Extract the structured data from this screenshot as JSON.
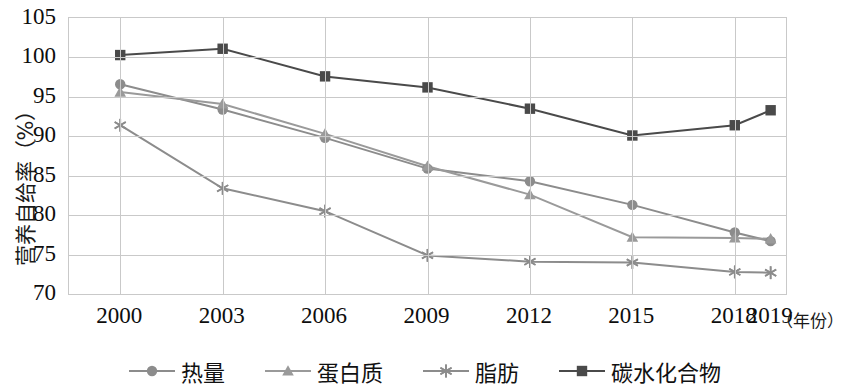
{
  "chart_data": {
    "type": "line",
    "title": "",
    "xlabel": "（年份）",
    "ylabel": "营养自给率（%）",
    "x": [
      "2000",
      "2003",
      "2006",
      "2009",
      "2012",
      "2015",
      "2018",
      "2019"
    ],
    "categories": [
      "2000",
      "2003",
      "2006",
      "2009",
      "2012",
      "2015",
      "2018",
      "2019"
    ],
    "x_positions": [
      0,
      1,
      2,
      3,
      4,
      5,
      6,
      6.35
    ],
    "ylim": [
      70,
      105
    ],
    "yticks": [
      70,
      75,
      80,
      85,
      90,
      95,
      100,
      105
    ],
    "grid": true,
    "legend_position": "bottom",
    "series": [
      {
        "name": "热量",
        "marker": "circle",
        "color": "#8c8c8c",
        "values": [
          96.6,
          93.4,
          89.8,
          85.9,
          84.3,
          81.3,
          77.8,
          76.7
        ]
      },
      {
        "name": "蛋白质",
        "marker": "triangle",
        "color": "#9a9a9a",
        "values": [
          95.6,
          94.1,
          90.3,
          86.2,
          82.6,
          77.2,
          77.1,
          77.0
        ]
      },
      {
        "name": "脂肪",
        "marker": "asterisk",
        "color": "#8c8c8c",
        "values": [
          91.4,
          83.4,
          80.5,
          74.9,
          74.1,
          74.0,
          72.8,
          72.7
        ]
      },
      {
        "name": "碳水化合物",
        "marker": "square",
        "color": "#4a4a4a",
        "values": [
          100.3,
          101.1,
          97.6,
          96.2,
          93.5,
          90.1,
          91.4,
          93.3
        ]
      }
    ]
  },
  "axis": {
    "y_title": "营养自给率（%）",
    "x_title": "（年份）",
    "y_tick_labels": [
      "105",
      "100",
      "95",
      "90",
      "85",
      "80",
      "75",
      "70"
    ],
    "x_tick_labels": [
      "2000",
      "2003",
      "2006",
      "2009",
      "2012",
      "2015",
      "2018",
      "2019"
    ]
  },
  "legend": {
    "items": [
      {
        "label": "热量",
        "marker": "circle"
      },
      {
        "label": "蛋白质",
        "marker": "triangle"
      },
      {
        "label": "脂肪",
        "marker": "asterisk"
      },
      {
        "label": "碳水化合物",
        "marker": "square"
      }
    ]
  }
}
